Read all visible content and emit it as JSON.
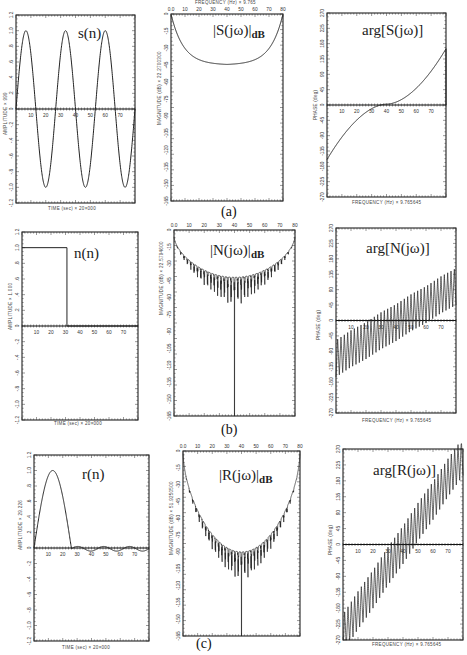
{
  "figure": {
    "rows": [
      {
        "caption": "(a)"
      },
      {
        "caption": "(b)"
      },
      {
        "caption": "(c)"
      }
    ]
  },
  "panels": {
    "s_time": {
      "title": "s(n)",
      "xlabel": "TIME (sec)  ×  20×000",
      "ylabel": "AMPLITUDE  ×  999"
    },
    "s_mag": {
      "title_main": "|S(jω)|",
      "title_sub": "dB",
      "xlabel": "FREQUENCY (Hz)  ×  9.765",
      "ylabel": "MAGNITUDE (dB)  ×  22.2700300"
    },
    "s_phase": {
      "title": "arg[S(jω)]",
      "xlabel": "FREQUENCY (Hz)  ×  9.765645",
      "ylabel": "PHASE (deg)"
    },
    "n_time": {
      "title": "n(n)",
      "xlabel": "TIME (sec)  ×  20×000",
      "ylabel": "AMPLITUDE  ×  1.000"
    },
    "n_mag": {
      "title_main": "|N(jω)|",
      "title_sub": "dB",
      "xlabel": "",
      "ylabel": "MAGNITUDE (dB)  ×  22.5794600"
    },
    "n_phase": {
      "title": "arg[N(jω)]",
      "xlabel": "FREQUENCY (Hz)  ×  9.765645",
      "ylabel": "PHASE (deg)"
    },
    "r_time": {
      "title": "r(n)",
      "xlabel": "TIME (sec)  ×  20×000",
      "ylabel": "AMPLITUDE  ×  29.226"
    },
    "r_mag": {
      "title_main": "|R(jω)|",
      "title_sub": "dB",
      "xlabel": "",
      "ylabel": "MAGNITUDE (dB)  ×  51.9250500"
    },
    "r_phase": {
      "title": "arg[R(jω)]",
      "xlabel": "FREQUENCY (Hz)  ×  9.765645",
      "ylabel": "PHASE (deg)"
    }
  },
  "chart_data": [
    {
      "id": "s_time",
      "type": "line",
      "title": "s(n)",
      "xlabel": "TIME (sec) x 20x000",
      "ylabel": "AMPLITUDE x 999",
      "x_ticks": [
        "10",
        "20",
        "30",
        "40",
        "50",
        "60",
        "70"
      ],
      "y_ticks": [
        "1.2",
        "1.0",
        ".8",
        ".6",
        ".4",
        ".2",
        "0",
        "-.2",
        "-.4",
        "-.6",
        "-.8",
        "-1.0",
        "-1.2"
      ],
      "xlim": [
        0,
        80
      ],
      "ylim": [
        -1.2,
        1.2
      ],
      "description": "sinusoid, ~3 periods over 0-80, amplitude ~1.0",
      "series": [
        {
          "name": "s(n)",
          "func": "sin",
          "amplitude": 1.0,
          "periods": 3.0,
          "phase": 0
        }
      ]
    },
    {
      "id": "s_mag",
      "type": "line",
      "title": "|S(jw)| dB",
      "xlabel": "FREQUENCY (Hz) x 9.765",
      "ylabel": "MAGNITUDE (dB)",
      "x_ticks": [
        "0.0",
        "10",
        "20",
        "30",
        "40",
        "50",
        "60",
        "70",
        "80"
      ],
      "y_ticks": [
        "0",
        "-15",
        "-30",
        "-45",
        "-60",
        "-75",
        "-90",
        "-105",
        "-120",
        "-135",
        "-150",
        "-165"
      ],
      "xlim": [
        0,
        80
      ],
      "ylim": [
        -165,
        0
      ],
      "description": "U-shaped magnitude, 0 dB at edges, minimum ~-45 dB at center",
      "series": [
        {
          "name": "|S|",
          "edge_db": 0,
          "min_db": -45
        }
      ]
    },
    {
      "id": "s_phase",
      "type": "line",
      "title": "arg[S(jw)]",
      "xlabel": "FREQUENCY (Hz) x 9.765645",
      "ylabel": "PHASE (deg)",
      "x_ticks": [
        "10",
        "20",
        "30",
        "40",
        "50",
        "60",
        "70"
      ],
      "y_ticks": [
        "270",
        "225",
        "180",
        "135",
        "90",
        "45",
        "0",
        "-45",
        "-90",
        "-135",
        "-180",
        "-225",
        "-270"
      ],
      "xlim": [
        0,
        80
      ],
      "ylim": [
        -270,
        270
      ],
      "description": "smooth monotonic increase from ~-160 deg to ~+165 deg, zero crossing ~40",
      "series": [
        {
          "name": "phase",
          "start_deg": -160,
          "end_deg": 165
        }
      ]
    },
    {
      "id": "n_time",
      "type": "line",
      "title": "n(n)",
      "xlabel": "TIME (sec) x 20x000",
      "ylabel": "AMPLITUDE x 1.000",
      "x_ticks": [
        "10",
        "20",
        "30",
        "40",
        "50",
        "60",
        "70"
      ],
      "y_ticks": [
        "1.2",
        "1.0",
        ".8",
        ".6",
        ".4",
        ".2",
        "0",
        "-.2",
        "-.4",
        "-.6",
        "-.8",
        "-1.0",
        "-1.2"
      ],
      "xlim": [
        0,
        80
      ],
      "ylim": [
        -1.2,
        1.2
      ],
      "description": "rectangular pulse amplitude 1.0 from 0 to ~31, then 0",
      "series": [
        {
          "name": "n(n)",
          "pulse_start": 0,
          "pulse_end": 31,
          "amplitude": 1.0
        }
      ]
    },
    {
      "id": "n_mag",
      "type": "line",
      "title": "|N(jw)| dB",
      "xlabel": "",
      "ylabel": "MAGNITUDE (dB)",
      "x_ticks": [
        "0.0",
        "10",
        "20",
        "30",
        "40",
        "50",
        "60",
        "70",
        "80"
      ],
      "y_ticks": [
        "0",
        "-15",
        "-30",
        "-45",
        "-60",
        "-75",
        "-90",
        "-105",
        "-120",
        "-135",
        "-150",
        "-165"
      ],
      "xlim": [
        0,
        80
      ],
      "ylim": [
        -165,
        0
      ],
      "description": "U-shaped envelope with dense nulls, deep null at center reaching -165 dB",
      "series": [
        {
          "name": "|N|",
          "edge_db": -5,
          "floor_db": -42,
          "ripples": 36,
          "center_null_db": -165
        }
      ]
    },
    {
      "id": "n_phase",
      "type": "line",
      "title": "arg[N(jw)]",
      "xlabel": "FREQUENCY (Hz) x 9.765645",
      "ylabel": "PHASE (deg)",
      "x_ticks": [
        "10",
        "20",
        "30",
        "40",
        "50",
        "60",
        "70"
      ],
      "y_ticks": [
        "270",
        "225",
        "180",
        "135",
        "90",
        "45",
        "0",
        "-45",
        "-90",
        "-135",
        "-180",
        "-225",
        "-270"
      ],
      "xlim": [
        0,
        80
      ],
      "ylim": [
        -270,
        270
      ],
      "description": "sawtooth oscillating phase with upward trend from ~-110 to ~+100 deg, swing ~100 deg",
      "series": [
        {
          "name": "phase",
          "trend_start": -110,
          "trend_end": 100,
          "swing": 110,
          "cycles": 36
        }
      ]
    },
    {
      "id": "r_time",
      "type": "line",
      "title": "r(n)",
      "xlabel": "TIME (sec) x 20x000",
      "ylabel": "AMPLITUDE x 29.226",
      "x_ticks": [
        "10",
        "20",
        "30",
        "40",
        "50",
        "60",
        "70"
      ],
      "y_ticks": [
        "1.2",
        "1.0",
        ".8",
        ".6",
        ".4",
        ".2",
        "0",
        "-.2",
        "-.4",
        "-.6",
        "-.8",
        "-1.0",
        "-1.2"
      ],
      "xlim": [
        0,
        80
      ],
      "ylim": [
        -1.2,
        1.2
      ],
      "description": "single hump peaking ~1.0 near 13, returning to 0 at ~26, small ripples afterwards",
      "series": [
        {
          "name": "r(n)",
          "hump_end": 26,
          "peak": 1.0,
          "ripple_amp": 0.03
        }
      ]
    },
    {
      "id": "r_mag",
      "type": "line",
      "title": "|R(jw)| dB",
      "xlabel": "",
      "ylabel": "MAGNITUDE (dB)",
      "x_ticks": [
        "0.0",
        "10",
        "20",
        "30",
        "40",
        "50",
        "60",
        "70",
        "80"
      ],
      "y_ticks": [
        "0",
        "-15",
        "-30",
        "-45",
        "-60",
        "-75",
        "-90",
        "-105",
        "-120",
        "-135",
        "-150",
        "-165"
      ],
      "xlim": [
        0,
        80
      ],
      "ylim": [
        -165,
        0
      ],
      "description": "deep U-shaped envelope with dense nulls, floor ~-90 dB, center null to -165 dB",
      "series": [
        {
          "name": "|R|",
          "edge_db": 0,
          "floor_db": -90,
          "ripples": 36,
          "center_null_db": -165
        }
      ]
    },
    {
      "id": "r_phase",
      "type": "line",
      "title": "arg[R(jw)]",
      "xlabel": "FREQUENCY (Hz) x 9.765645",
      "ylabel": "PHASE (deg)",
      "x_ticks": [
        "10",
        "20",
        "30",
        "40",
        "50",
        "60",
        "70"
      ],
      "y_ticks": [
        "270",
        "225",
        "180",
        "135",
        "90",
        "45",
        "0",
        "-45",
        "-90",
        "-135",
        "-180",
        "-225",
        "-270"
      ],
      "xlim": [
        0,
        80
      ],
      "ylim": [
        -270,
        270
      ],
      "description": "sawtooth oscillating phase with strong upward trend from ~-250 to ~+250 deg",
      "series": [
        {
          "name": "phase",
          "trend_start": -250,
          "trend_end": 250,
          "swing": 110,
          "cycles": 36
        }
      ]
    }
  ]
}
